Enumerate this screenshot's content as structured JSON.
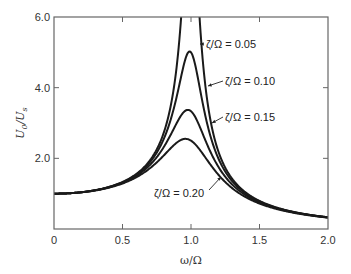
{
  "chart_data": {
    "type": "line",
    "title": "",
    "xlabel": "ω/Ω",
    "ylabel": "U0/Us",
    "xlim": [
      0,
      2.0
    ],
    "ylim": [
      0,
      6.0
    ],
    "grid": false,
    "legend": "inline annotations with arrows",
    "x_ticks": [
      "0",
      "0.5",
      "1.0",
      "1.5",
      "2.0"
    ],
    "y_ticks": [
      "2.0",
      "4.0",
      "6.0"
    ],
    "x": [
      0,
      0.1,
      0.2,
      0.3,
      0.4,
      0.5,
      0.6,
      0.7,
      0.75,
      0.8,
      0.85,
      0.9,
      0.93,
      0.95,
      0.97,
      0.98,
      0.99,
      1.0,
      1.01,
      1.02,
      1.03,
      1.05,
      1.07,
      1.1,
      1.15,
      1.2,
      1.25,
      1.3,
      1.4,
      1.5,
      1.6,
      1.7,
      1.8,
      1.9,
      2.0
    ],
    "series": [
      {
        "name": "ζ/Ω = 0.05",
        "values": [
          1.0,
          1.01,
          1.04,
          1.1,
          1.19,
          1.33,
          1.56,
          1.95,
          2.27,
          2.74,
          3.48,
          4.84,
          6.12,
          7.61,
          9.41,
          9.95,
          9.87,
          10.0,
          9.71,
          9.13,
          8.31,
          6.38,
          4.93,
          3.58,
          2.31,
          1.77,
          1.29,
          1.34,
          1.03,
          0.79,
          0.64,
          0.52,
          0.44,
          0.38,
          0.33
        ]
      },
      {
        "name": "ζ/Ω = 0.10",
        "values": [
          1.0,
          1.01,
          1.04,
          1.09,
          1.18,
          1.32,
          1.53,
          1.89,
          2.16,
          2.55,
          3.1,
          3.9,
          4.43,
          4.76,
          4.96,
          5.0,
          5.01,
          5.0,
          4.95,
          4.84,
          4.68,
          4.25,
          3.77,
          3.1,
          2.3,
          1.8,
          1.48,
          1.24,
          0.94,
          0.76,
          0.62,
          0.52,
          0.44,
          0.38,
          0.33
        ]
      },
      {
        "name": "ζ/Ω = 0.15",
        "values": [
          1.0,
          1.01,
          1.04,
          1.09,
          1.18,
          1.31,
          1.5,
          1.8,
          2.02,
          2.31,
          2.67,
          3.07,
          3.26,
          3.33,
          3.36,
          3.35,
          3.34,
          3.33,
          3.28,
          3.22,
          3.14,
          2.96,
          2.76,
          2.45,
          1.98,
          1.63,
          1.37,
          1.18,
          0.91,
          0.74,
          0.61,
          0.51,
          0.44,
          0.38,
          0.33
        ]
      },
      {
        "name": "ζ/Ω = 0.20",
        "values": [
          1.0,
          1.01,
          1.04,
          1.09,
          1.17,
          1.29,
          1.46,
          1.7,
          1.86,
          2.05,
          2.27,
          2.46,
          2.54,
          2.56,
          2.56,
          2.55,
          2.53,
          2.5,
          2.47,
          2.43,
          2.39,
          2.29,
          2.18,
          2.01,
          1.74,
          1.49,
          1.29,
          1.13,
          0.89,
          0.72,
          0.6,
          0.51,
          0.43,
          0.37,
          0.33
        ]
      }
    ],
    "annotations": [
      {
        "text": "ζ/Ω = 0.05",
        "series": 0
      },
      {
        "text": "ζ/Ω = 0.10",
        "series": 1
      },
      {
        "text": "ζ/Ω = 0.15",
        "series": 2
      },
      {
        "text": "ζ/Ω = 0.20",
        "series": 3
      }
    ]
  },
  "axes": {
    "y_label_main": "U",
    "y_label_sub1": "0",
    "y_label_sep": "/U",
    "y_label_sub2": "s",
    "x_label": "ω/Ω"
  }
}
